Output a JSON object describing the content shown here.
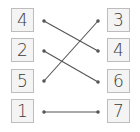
{
  "left_column": [
    {
      "value": "4"
    },
    {
      "value": "2"
    },
    {
      "value": "5"
    },
    {
      "value": "1"
    }
  ],
  "right_column": [
    {
      "value": "3"
    },
    {
      "value": "4"
    },
    {
      "value": "6"
    },
    {
      "value": "7"
    }
  ],
  "connections": [
    {
      "from": "4",
      "to": "4"
    },
    {
      "from": "2",
      "to": "6"
    },
    {
      "from": "5",
      "to": "3"
    },
    {
      "from": "1",
      "to": "7"
    }
  ],
  "colors": {
    "line": "#555555",
    "box_border": "#bdbdbd",
    "box_fill": "#f4f4f4",
    "text": "#3a3a3a"
  }
}
